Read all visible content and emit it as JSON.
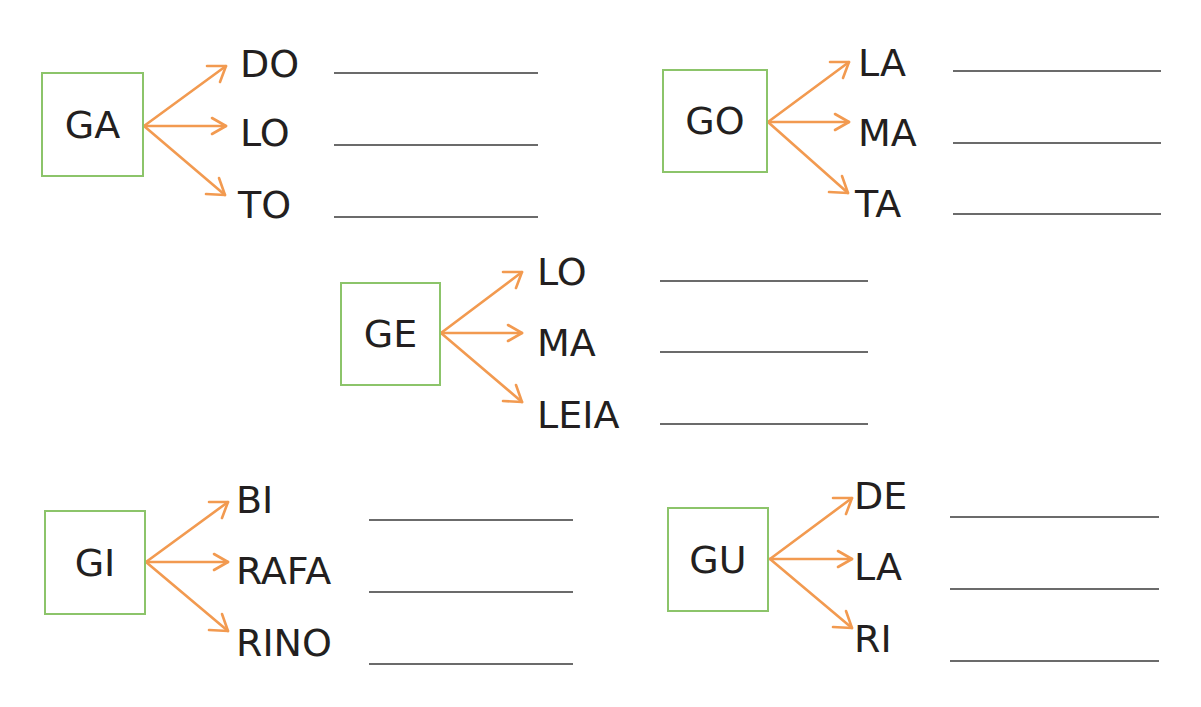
{
  "colors": {
    "box_border": "#8cc46a",
    "arrow": "#f29a50",
    "answer_line": "#6b6b6b",
    "text": "#231f20"
  },
  "groups": [
    {
      "syllable": "GA",
      "endings": [
        "DO",
        "LO",
        "TO"
      ],
      "answers": [
        "",
        "",
        ""
      ]
    },
    {
      "syllable": "GO",
      "endings": [
        "LA",
        "MA",
        "TA"
      ],
      "answers": [
        "",
        "",
        ""
      ]
    },
    {
      "syllable": "GE",
      "endings": [
        "LO",
        "MA",
        "LEIA"
      ],
      "answers": [
        "",
        "",
        ""
      ]
    },
    {
      "syllable": "GI",
      "endings": [
        "BI",
        "RAFA",
        "RINO"
      ],
      "answers": [
        "",
        "",
        ""
      ]
    },
    {
      "syllable": "GU",
      "endings": [
        "DE",
        "LA",
        "RI"
      ],
      "answers": [
        "",
        "",
        ""
      ]
    }
  ]
}
